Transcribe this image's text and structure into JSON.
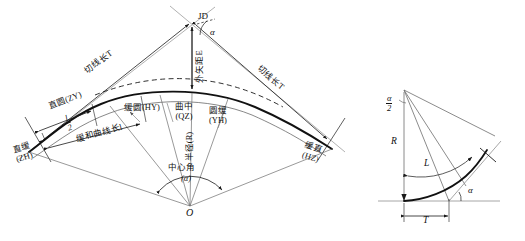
{
  "diagram": {
    "type": "engineering-survey-curve-diagram",
    "main": {
      "vertex": {
        "code": "JD",
        "label": "JD",
        "angle_symbol": "α",
        "description": "intersection point / 交点"
      },
      "tangent_left": {
        "label": "切线长T",
        "symbol": "T"
      },
      "tangent_right": {
        "label": "切线长T",
        "symbol": "T"
      },
      "external_distance": {
        "label": "外矢距E",
        "symbol": "E"
      },
      "points": [
        {
          "cn": "直缓",
          "code": "(ZH)"
        },
        {
          "cn": "直圆",
          "code": "(ZY)"
        },
        {
          "cn": "缓圆",
          "code": "(HY)"
        },
        {
          "cn": "曲中",
          "code": "(QZ)"
        },
        {
          "cn": "圆缓",
          "code": "(YH)"
        },
        {
          "cn": "缓直",
          "code": "(HZ)"
        }
      ],
      "half_transition": {
        "label": "l/2",
        "num": "l",
        "den": "2"
      },
      "transition_length": {
        "label": "缓和曲线长l",
        "symbol": "l"
      },
      "radius": {
        "label": "半径(R)",
        "symbol": "R"
      },
      "central_angle": {
        "cn": "中心角",
        "symbol": "(α)"
      },
      "center": {
        "label": "O"
      }
    },
    "inset": {
      "half_angle": {
        "num": "α",
        "den": "2"
      },
      "radius": "R",
      "arc_length": "L",
      "tangent": "T",
      "angle": "α"
    },
    "colors": {
      "stroke_dark": "#1a1a1a",
      "stroke_light": "#888888",
      "background": "#ffffff"
    }
  }
}
